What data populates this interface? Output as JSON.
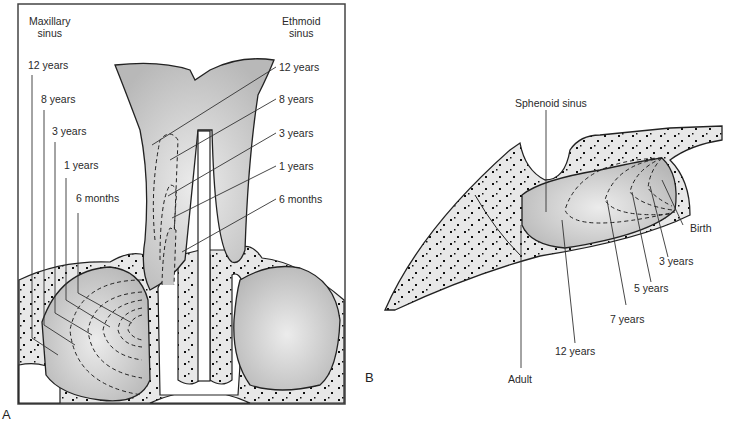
{
  "figure": {
    "panel_a": {
      "letter": "A",
      "left_header_line1": "Maxillary",
      "left_header_line2": "sinus",
      "right_header_line1": "Ethmoid",
      "right_header_line2": "sinus",
      "maxillary_labels": [
        "12 years",
        "8 years",
        "3 years",
        "1 years",
        "6 months"
      ],
      "ethmoid_labels": [
        "12 years",
        "8 years",
        "3 years",
        "1 years",
        "6 months"
      ]
    },
    "panel_b": {
      "letter": "B",
      "title": "Sphenoid sinus",
      "labels": [
        "Birth",
        "3 years",
        "5 years",
        "7 years",
        "12 years",
        "Adult"
      ]
    },
    "colors": {
      "sinus_fill": "#c8c8c8",
      "bone_fill": "#e6e6e6",
      "outline": "#222222"
    }
  }
}
